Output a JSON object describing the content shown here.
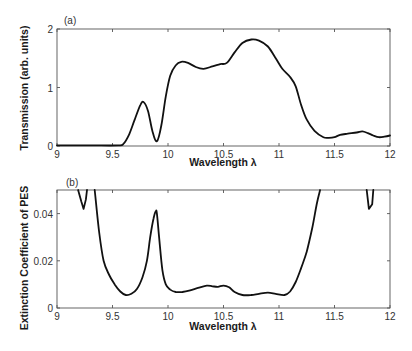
{
  "chart_data": [
    {
      "type": "line",
      "panel_label": "(a)",
      "title": "",
      "xlabel": "Wavelength λ",
      "ylabel": "Transmission (arb. units)",
      "xlim": [
        9,
        12
      ],
      "ylim": [
        0,
        2
      ],
      "xticks": [
        "9",
        "9.5",
        "10",
        "10.5",
        "11",
        "11.5",
        "12"
      ],
      "yticks": [
        "0",
        "1",
        "2"
      ],
      "grid": false,
      "legend": null,
      "series": [
        {
          "name": "Transmission",
          "x": [
            9.0,
            9.3,
            9.55,
            9.6,
            9.65,
            9.7,
            9.75,
            9.78,
            9.82,
            9.86,
            9.9,
            9.94,
            9.98,
            10.02,
            10.07,
            10.12,
            10.18,
            10.25,
            10.32,
            10.4,
            10.47,
            10.53,
            10.6,
            10.67,
            10.75,
            10.82,
            10.9,
            10.97,
            11.03,
            11.1,
            11.15,
            11.2,
            11.25,
            11.32,
            11.4,
            11.45,
            11.5,
            11.55,
            11.62,
            11.7,
            11.75,
            11.8,
            11.85,
            11.9,
            11.95,
            12.0
          ],
          "values": [
            0.01,
            0.01,
            0.01,
            0.04,
            0.2,
            0.45,
            0.7,
            0.75,
            0.6,
            0.25,
            0.08,
            0.35,
            0.85,
            1.2,
            1.38,
            1.44,
            1.42,
            1.35,
            1.32,
            1.36,
            1.4,
            1.42,
            1.6,
            1.76,
            1.82,
            1.8,
            1.7,
            1.5,
            1.32,
            1.18,
            1.02,
            0.7,
            0.45,
            0.26,
            0.15,
            0.14,
            0.15,
            0.19,
            0.21,
            0.23,
            0.25,
            0.22,
            0.18,
            0.15,
            0.16,
            0.18
          ]
        }
      ]
    },
    {
      "type": "line",
      "panel_label": "(b)",
      "title": "",
      "xlabel": "Wavelength λ",
      "ylabel": "Extinction Coefficient of  PES",
      "xlim": [
        9,
        12
      ],
      "ylim": [
        0,
        0.05
      ],
      "xticks": [
        "9",
        "9.5",
        "10",
        "10.5",
        "11",
        "11.5",
        "12"
      ],
      "yticks": [
        "0",
        "0.02",
        "0.04"
      ],
      "grid": false,
      "legend": null,
      "series": [
        {
          "name": "Extinction coefficient (segment left)",
          "x": [
            9.19,
            9.22,
            9.24,
            9.26,
            9.27
          ],
          "values": [
            0.05,
            0.045,
            0.042,
            0.046,
            0.05
          ]
        },
        {
          "name": "Extinction coefficient (main)",
          "x": [
            9.34,
            9.38,
            9.42,
            9.47,
            9.52,
            9.57,
            9.62,
            9.67,
            9.72,
            9.77,
            9.81,
            9.84,
            9.87,
            9.89,
            9.9,
            9.92,
            9.95,
            9.98,
            10.02,
            10.07,
            10.13,
            10.2,
            10.27,
            10.35,
            10.4,
            10.45,
            10.5,
            10.55,
            10.6,
            10.67,
            10.75,
            10.82,
            10.9,
            10.97,
            11.05,
            11.1,
            11.15,
            11.2,
            11.25,
            11.3,
            11.34,
            11.37
          ],
          "values": [
            0.05,
            0.032,
            0.02,
            0.014,
            0.01,
            0.007,
            0.0055,
            0.006,
            0.008,
            0.013,
            0.02,
            0.03,
            0.038,
            0.041,
            0.04,
            0.03,
            0.016,
            0.01,
            0.0078,
            0.0068,
            0.0068,
            0.0075,
            0.0085,
            0.0095,
            0.0092,
            0.009,
            0.0095,
            0.0088,
            0.0068,
            0.0055,
            0.0055,
            0.006,
            0.0065,
            0.006,
            0.0055,
            0.007,
            0.011,
            0.017,
            0.024,
            0.034,
            0.044,
            0.05
          ]
        },
        {
          "name": "Extinction coefficient (segment right)",
          "x": [
            11.79,
            11.8,
            11.81,
            11.84,
            11.85
          ],
          "values": [
            0.05,
            0.046,
            0.042,
            0.044,
            0.05
          ]
        }
      ]
    }
  ]
}
